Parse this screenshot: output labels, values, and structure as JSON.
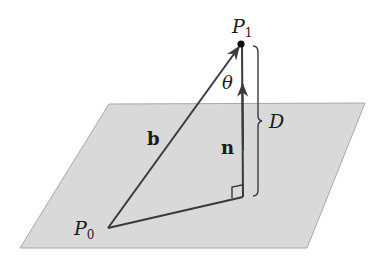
{
  "diagram": {
    "colors": {
      "plane_fill": "#d9d9d9",
      "plane_stroke": "#a8a8a8",
      "line": "#3a3a3a",
      "background": "#ffffff"
    },
    "plane": {
      "corners": [
        [
          109,
          104
        ],
        [
          365,
          103
        ],
        [
          307,
          248
        ],
        [
          20,
          248
        ]
      ]
    },
    "points": {
      "P0": {
        "label_main": "P",
        "label_sub": "0",
        "x": 108,
        "y": 228
      },
      "P1": {
        "label_main": "P",
        "label_sub": "1",
        "x": 241,
        "y": 44
      },
      "foot": {
        "x": 243,
        "y": 197
      }
    },
    "vectors": {
      "b": {
        "label": "b",
        "from": "P0",
        "to": "P1"
      },
      "n": {
        "label": "n",
        "from": "foot",
        "direction": "up"
      }
    },
    "angle": {
      "label": "θ"
    },
    "distance": {
      "label": "D"
    }
  }
}
